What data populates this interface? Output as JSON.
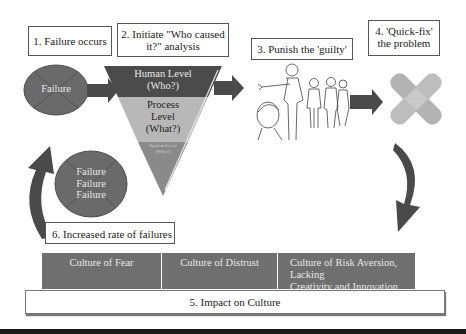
{
  "steps": {
    "step1": "1. Failure occurs",
    "step2_line1": "2. Initiate \"Who caused",
    "step2_line2": "it?\" analysis",
    "step3": "3. Punish the 'guilty'",
    "step4_line1": "4. 'Quick-fix'",
    "step4_line2": "the problem",
    "step5": "5. Impact on Culture",
    "step6": "6. Increased rate of failures"
  },
  "failure_oval": {
    "label": "Failure"
  },
  "repeat_oval": {
    "lines": [
      "Failure",
      "Failure",
      "Failure"
    ]
  },
  "funnel": {
    "levels": [
      {
        "line1": "Human Level",
        "line2": "(Who?)"
      },
      {
        "line1": "Process",
        "line2": "Level",
        "line3": "(What?)"
      },
      {
        "line1": "System Level",
        "line2": "(Why?)"
      }
    ]
  },
  "culture": {
    "blocks": [
      {
        "label": "Culture of Fear"
      },
      {
        "label": "Culture of Distrust"
      },
      {
        "line1": "Culture of Risk Aversion, Lacking",
        "line2": "Creativity and Innovation"
      }
    ]
  },
  "colors": {
    "dark_gray": "#5f5f5f",
    "mid_gray": "#6f6f6f",
    "light_gray": "#b8b8b8",
    "arrow_gray": "#4a4a4a",
    "bandage": "#b5b5b5"
  }
}
